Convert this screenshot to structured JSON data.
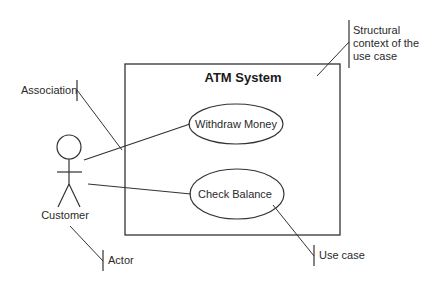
{
  "diagram": {
    "type": "UML use case diagram",
    "system": {
      "title": "ATM System"
    },
    "actor": {
      "label": "Customer"
    },
    "use_cases": [
      {
        "label": "Withdraw Money"
      },
      {
        "label": "Check Balance"
      }
    ],
    "annotations": {
      "association": "Association",
      "structural_context": [
        "Structural",
        "context of the",
        "use case"
      ],
      "use_case": "Use case",
      "actor": "Actor"
    },
    "colors": {
      "line": "#333333",
      "text": "#2a2a2a",
      "background": "#ffffff"
    }
  }
}
